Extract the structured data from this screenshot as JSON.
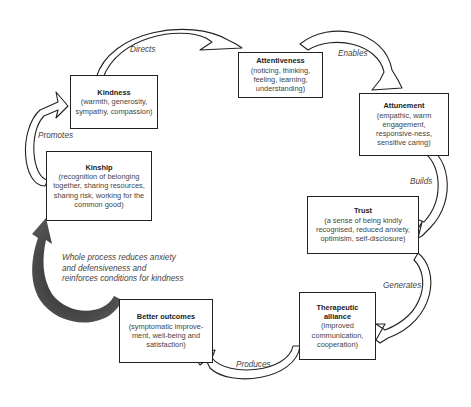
{
  "diagram": {
    "type": "cycle",
    "nodes": [
      {
        "id": "kindness",
        "title": "Kindness",
        "desc": "(warmth, generosity, sympathy, compassion)"
      },
      {
        "id": "attentiveness",
        "title": "Attentiveness",
        "desc": "(noticing, thinking, feeling, learning, understanding)"
      },
      {
        "id": "attunement",
        "title": "Attunement",
        "desc": "(empathic, warm engagement, responsive-ness, sensitive caring)"
      },
      {
        "id": "trust",
        "title": "Trust",
        "desc": "(a sense of being kindly recognised, reduced anxiety, optimisim, self-disclosure)"
      },
      {
        "id": "therapeutic_alliance",
        "title": "Therapeutic alliance",
        "desc": "(improved communication, cooperation)"
      },
      {
        "id": "better_outcomes",
        "title": "Better outcomes",
        "desc": "(symptomatic improve-ment, well-being and satisfaction)"
      },
      {
        "id": "kinship",
        "title": "Kinship",
        "desc": "(recognition of belonging together, sharing resources, sharing risk, working for the common good)"
      }
    ],
    "edges": [
      {
        "from": "kindness",
        "to": "attentiveness",
        "label": "Directs"
      },
      {
        "from": "attentiveness",
        "to": "attunement",
        "label": "Enables"
      },
      {
        "from": "attunement",
        "to": "trust",
        "label": "Builds"
      },
      {
        "from": "trust",
        "to": "therapeutic_alliance",
        "label": "Generates"
      },
      {
        "from": "therapeutic_alliance",
        "to": "better_outcomes",
        "label": "Produces"
      },
      {
        "from": "better_outcomes",
        "to": "kinship",
        "label": ""
      },
      {
        "from": "kinship",
        "to": "kindness",
        "label": "Promotes"
      }
    ],
    "note": {
      "line1": "Whole process reduces anxiety",
      "line2": "and defensiveness and",
      "line3": "reinforces conditions for kindness"
    }
  }
}
